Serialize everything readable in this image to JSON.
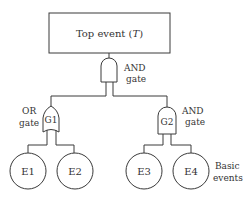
{
  "diagram": {
    "type": "fault-tree",
    "top_event": {
      "label": "Top event (",
      "italic": "T",
      "suffix": ")"
    },
    "top_gate": {
      "type": "AND",
      "label_line1": "AND",
      "label_line2": "gate"
    },
    "gates": [
      {
        "id": "G1",
        "type": "OR",
        "label_line1": "OR",
        "label_line2": "gate"
      },
      {
        "id": "G2",
        "type": "AND",
        "label_line1": "AND",
        "label_line2": "gate"
      }
    ],
    "basic_events": [
      "E1",
      "E2",
      "E3",
      "E4"
    ],
    "basic_events_label_line1": "Basic",
    "basic_events_label_line2": "events"
  }
}
